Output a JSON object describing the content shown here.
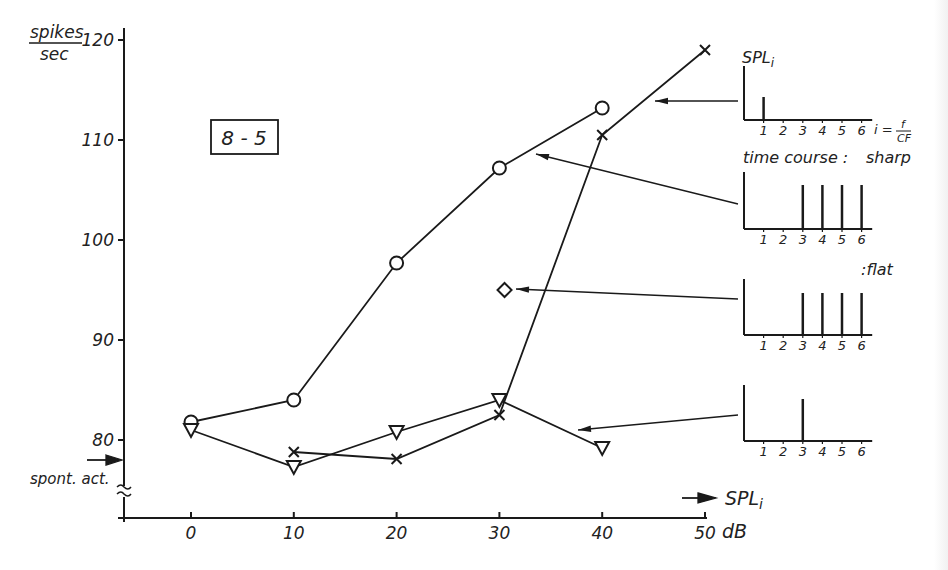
{
  "chart_data": {
    "type": "line",
    "title": "8-5",
    "xlabel": "SPL_i",
    "x_unit": "dB",
    "ylabel": "spikes/sec",
    "xlim": [
      -7,
      52
    ],
    "ylim": [
      72,
      121
    ],
    "y_axis_broken": true,
    "grid": false,
    "x_ticks": [
      0,
      10,
      20,
      30,
      40,
      50
    ],
    "x_tick_labels": [
      "0",
      "10",
      "20",
      "30",
      "40",
      "50"
    ],
    "y_ticks": [
      80,
      90,
      100,
      110,
      120
    ],
    "y_tick_labels": [
      "80",
      "90",
      "100",
      "110",
      "120"
    ],
    "spontaneous_activity": {
      "label": "spont. act.",
      "value": 78
    },
    "series": [
      {
        "name": "harmonics 3-6, time course sharp",
        "marker": "circle",
        "x": [
          0,
          10,
          20,
          30,
          40
        ],
        "values": [
          81.8,
          84.0,
          97.7,
          107.2,
          113.2
        ]
      },
      {
        "name": "harmonic 1 only",
        "marker": "cross",
        "x": [
          10,
          20,
          30,
          40,
          50
        ],
        "values": [
          78.8,
          78.1,
          82.5,
          110.5,
          119.0
        ]
      },
      {
        "name": "harmonic 3 only",
        "marker": "triangle-down",
        "x": [
          0,
          10,
          20,
          30,
          40
        ],
        "values": [
          81.0,
          77.3,
          80.8,
          84.0,
          79.2
        ]
      },
      {
        "name": "harmonics 3-6, time course flat",
        "marker": "diamond",
        "x": [
          30.5
        ],
        "values": [
          95.0
        ]
      }
    ],
    "annotations": [
      "8 - 5",
      "spont. act.",
      "SPL_i",
      "dB",
      "time course : sharp",
      ":flat",
      "i = f / CF"
    ],
    "insets": [
      {
        "ylabel": "SPL_i",
        "x_ticks": [
          "1",
          "2",
          "3",
          "4",
          "5",
          "6"
        ],
        "xlabel": "i = f/CF",
        "bars": [
          1
        ],
        "points_to": "cross"
      },
      {
        "label": "time course : sharp",
        "x_ticks": [
          "1",
          "2",
          "3",
          "4",
          "5",
          "6"
        ],
        "bars": [
          3,
          4,
          5,
          6
        ],
        "points_to": "circle"
      },
      {
        "label": ":flat",
        "x_ticks": [
          "1",
          "2",
          "3",
          "4",
          "5",
          "6"
        ],
        "bars": [
          3,
          4,
          5,
          6
        ],
        "points_to": "diamond"
      },
      {
        "x_ticks": [
          "1",
          "2",
          "3",
          "4",
          "5",
          "6"
        ],
        "bars": [
          3
        ],
        "points_to": "triangle-down"
      }
    ]
  },
  "labels": {
    "ylabel_top": "spikes",
    "ylabel_bottom": "sec",
    "panel_id": "8 - 5",
    "spont": "spont. act.",
    "xlabel": "SPL",
    "xlabel_sub": "i",
    "x_unit": "dB",
    "inset_ylabel": "SPL",
    "inset_ylabel_sub": "i",
    "inset_xlabel_i": "i =",
    "inset_xlabel_num": "f",
    "inset_xlabel_den": "CF",
    "time_course": "time course :",
    "sharp": "sharp",
    "flat": ":flat"
  },
  "colors": {
    "ink": "#1a1a1a",
    "paper": "#ffffff"
  }
}
